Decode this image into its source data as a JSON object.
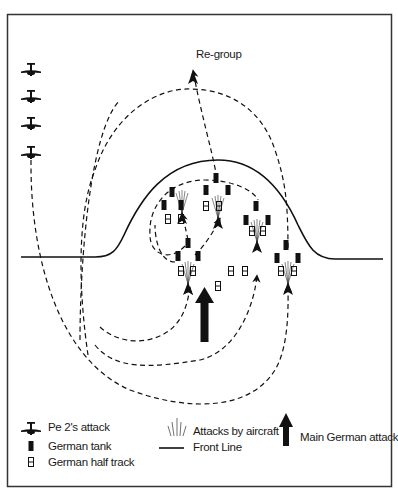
{
  "title_label": "Re-group",
  "colors": {
    "ink": "#111111",
    "background": "#ffffff",
    "frame": "#333333"
  },
  "legend": {
    "pe2_attack": "Pe 2's attack",
    "german_tank": "German tank",
    "german_half_track": "German half track",
    "attacks_by_aircraft": "Attacks by aircraft",
    "front_line": "Front Line",
    "main_german_attack": "Main German attack"
  },
  "icons": {
    "plane": "pe2-plane-icon",
    "tank": "german-tank-icon",
    "half_track": "german-half-track-icon",
    "aircraft_attack": "aircraft-attack-burst-icon",
    "main_attack": "main-attack-arrow-icon"
  },
  "planes_column": [
    {
      "x": 31,
      "y": 70
    },
    {
      "x": 31,
      "y": 97
    },
    {
      "x": 31,
      "y": 124
    },
    {
      "x": 31,
      "y": 153
    }
  ],
  "tanks": [
    {
      "x": 172,
      "y": 192
    },
    {
      "x": 164,
      "y": 205
    },
    {
      "x": 181,
      "y": 205
    },
    {
      "x": 216,
      "y": 178
    },
    {
      "x": 206,
      "y": 190
    },
    {
      "x": 228,
      "y": 190
    },
    {
      "x": 256,
      "y": 206
    },
    {
      "x": 246,
      "y": 220
    },
    {
      "x": 268,
      "y": 220
    },
    {
      "x": 188,
      "y": 243
    },
    {
      "x": 178,
      "y": 256
    },
    {
      "x": 198,
      "y": 256
    },
    {
      "x": 286,
      "y": 245
    },
    {
      "x": 277,
      "y": 258
    },
    {
      "x": 298,
      "y": 258
    }
  ],
  "half_tracks": [
    {
      "x": 168,
      "y": 219
    },
    {
      "x": 181,
      "y": 219
    },
    {
      "x": 206,
      "y": 206
    },
    {
      "x": 219,
      "y": 206
    },
    {
      "x": 252,
      "y": 231
    },
    {
      "x": 263,
      "y": 231
    },
    {
      "x": 181,
      "y": 271
    },
    {
      "x": 193,
      "y": 271
    },
    {
      "x": 231,
      "y": 271
    },
    {
      "x": 245,
      "y": 271
    },
    {
      "x": 218,
      "y": 286
    },
    {
      "x": 281,
      "y": 271
    },
    {
      "x": 294,
      "y": 271
    }
  ]
}
